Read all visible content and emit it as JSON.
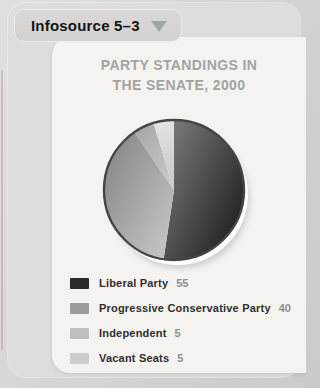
{
  "page": {
    "bg_color": "#d6d5d3",
    "panel_color": "#f4f3f0"
  },
  "infosource_tab": {
    "label": "Infosource 5–3",
    "triangle_color": "#9da8a5"
  },
  "chart_data": {
    "type": "pie",
    "title": "PARTY STANDINGS IN THE SENATE, 2000",
    "title_lines": [
      "PARTY STANDINGS IN",
      "THE SENATE, 2000"
    ],
    "title_color": "#a3a3a1",
    "total_seats": 105,
    "start_angle_deg": 0,
    "direction": "clockwise",
    "legend_position": "bottom-left",
    "slices": [
      {
        "label": "Liberal Party",
        "value": 55,
        "color": "#2a2a28",
        "color_light": "#7e7e7e",
        "color_dark": "#1c1c1c"
      },
      {
        "label": "Progressive Conservative Party",
        "value": 40,
        "color": "#9c9c9a",
        "color_light": "#c7c7c5",
        "color_dark": "#858583"
      },
      {
        "label": "Independent",
        "value": 5,
        "color": "#bfbfbd",
        "color_light": "#c9c9c7",
        "color_dark": "#a6a6a4"
      },
      {
        "label": "Vacant Seats",
        "value": 5,
        "color": "#cecdcb",
        "color_light": "#e3e3e1",
        "color_dark": "#c6c6c4"
      }
    ]
  }
}
